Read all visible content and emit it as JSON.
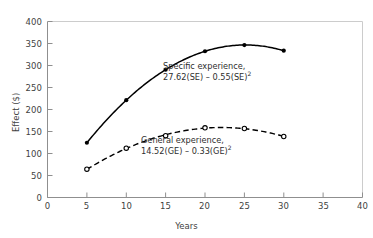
{
  "chart_data": {
    "type": "line",
    "title": "",
    "subtitle": "",
    "xlabel": "Years",
    "ylabel": "Effect ($)",
    "xlim": [
      0,
      40
    ],
    "ylim": [
      0,
      400
    ],
    "xticks": [
      0,
      5,
      10,
      15,
      20,
      25,
      30,
      35,
      40
    ],
    "yticks": [
      0,
      50,
      100,
      150,
      200,
      250,
      300,
      350,
      400
    ],
    "xtick_labels": [
      "0",
      "5",
      "10",
      "15",
      "20",
      "25",
      "30",
      "35",
      "40"
    ],
    "ytick_labels": [
      "0",
      "50",
      "100",
      "150",
      "200",
      "250",
      "300",
      "350",
      "400"
    ],
    "grid": false,
    "legend": "inline-annotations",
    "x": [
      5,
      10,
      15,
      20,
      25,
      30
    ],
    "series": [
      {
        "name": "Specific experience",
        "equation": "27.62(SE) – 0.55(SE)",
        "equation_exponent": "2",
        "linestyle": "solid",
        "marker": "filled-circle",
        "color": "#000000",
        "values": [
          124.4,
          221.2,
          290.4,
          332.4,
          346.5,
          333.6
        ]
      },
      {
        "name": "General experience",
        "equation": "14.52(GE) – 0.33(GE)",
        "equation_exponent": "2",
        "linestyle": "dashed",
        "marker": "open-circle",
        "color": "#000000",
        "values": [
          64.4,
          112.2,
          140.6,
          158.4,
          156.8,
          138.6
        ]
      }
    ],
    "annotations": [
      {
        "id": "specific-experience",
        "line1": "Specific experience,",
        "line2": "27.62(SE) – 0.55(SE)",
        "exponent": "2"
      },
      {
        "id": "general-experience",
        "line1": "General experience,",
        "line2": "14.52(GE) – 0.33(GE)",
        "exponent": "2"
      }
    ],
    "style": {
      "frame_color": "#c9c9c9",
      "axis_color": "#8f8f8f",
      "curve_color": "#111111",
      "background": "#ffffff"
    }
  }
}
